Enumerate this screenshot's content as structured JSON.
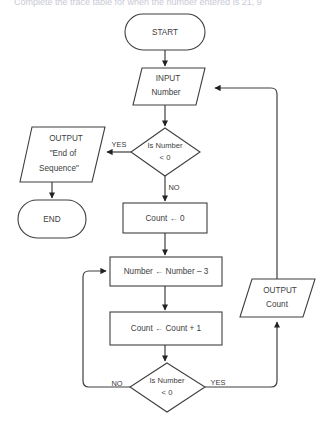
{
  "page": {
    "heading": "Complete the trace table for when the number entered is 21, 9",
    "width": 330,
    "height": 423,
    "background_color": "#ffffff",
    "line_color": "#3f3f3f",
    "text_color": "#404040"
  },
  "flowchart": {
    "type": "flowchart",
    "title": "Number subtraction loop flowchart",
    "nodes": [
      {
        "id": "start",
        "shape": "terminator",
        "lines": [
          "START"
        ]
      },
      {
        "id": "input_number",
        "shape": "parallelogram",
        "lines": [
          "INPUT",
          "Number"
        ]
      },
      {
        "id": "decision_1",
        "shape": "diamond",
        "lines": [
          "Is Number",
          "< 0"
        ]
      },
      {
        "id": "output_eos",
        "shape": "parallelogram",
        "lines": [
          "OUTPUT",
          "\"End of",
          "Sequence\""
        ]
      },
      {
        "id": "end",
        "shape": "terminator",
        "lines": [
          "END"
        ]
      },
      {
        "id": "count_init",
        "shape": "process",
        "lines": [
          "Count ← 0"
        ]
      },
      {
        "id": "number_sub",
        "shape": "process",
        "lines": [
          "Number ← Number – 3"
        ]
      },
      {
        "id": "count_inc",
        "shape": "process",
        "lines": [
          "Count ← Count + 1"
        ]
      },
      {
        "id": "decision_2",
        "shape": "diamond",
        "lines": [
          "Is Number",
          "< 0"
        ]
      },
      {
        "id": "output_count",
        "shape": "parallelogram",
        "lines": [
          "OUTPUT",
          "Count"
        ]
      }
    ],
    "edges": [
      {
        "from": "start",
        "to": "input_number",
        "label": ""
      },
      {
        "from": "input_number",
        "to": "decision_1",
        "label": ""
      },
      {
        "from": "decision_1",
        "to": "output_eos",
        "label": "YES"
      },
      {
        "from": "decision_1",
        "to": "count_init",
        "label": "NO"
      },
      {
        "from": "output_eos",
        "to": "end",
        "label": ""
      },
      {
        "from": "count_init",
        "to": "number_sub",
        "label": ""
      },
      {
        "from": "number_sub",
        "to": "count_inc",
        "label": ""
      },
      {
        "from": "count_inc",
        "to": "decision_2",
        "label": ""
      },
      {
        "from": "decision_2",
        "to": "number_sub",
        "label": "NO"
      },
      {
        "from": "decision_2",
        "to": "output_count",
        "label": "YES"
      },
      {
        "from": "output_count",
        "to": "input_number",
        "label": ""
      }
    ],
    "labels": {
      "yes_top": "YES",
      "no_top": "NO",
      "no_bottom": "NO",
      "yes_bottom": "YES"
    }
  }
}
